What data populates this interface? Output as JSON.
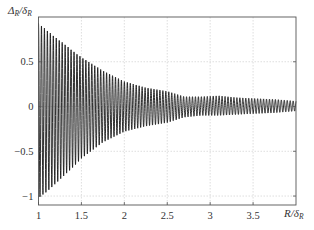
{
  "chart_data": {
    "type": "line",
    "title": "",
    "xlabel": "R/δ_R",
    "ylabel": "Δ_R/δ_R",
    "xlabel_parts": {
      "main": "R/δ",
      "sub": "R"
    },
    "ylabel_parts": {
      "main": "Δ",
      "sub1": "R",
      "mid": "/δ",
      "sub2": "R"
    },
    "xlim": [
      1,
      4
    ],
    "ylim": [
      -1.1,
      1.0
    ],
    "xticks": [
      1,
      1.5,
      2,
      2.5,
      3,
      3.5
    ],
    "xtick_labels": [
      "1",
      "1.5",
      "2",
      "2.5",
      "3",
      "3.5"
    ],
    "yticks": [
      -1,
      -0.5,
      0,
      0.5
    ],
    "ytick_labels": [
      "−1",
      "−0.5",
      "0",
      "0.5"
    ],
    "grid": true,
    "legend": null,
    "series": [
      {
        "name": "Δ_R/δ_R",
        "description": "rapid oscillation about 0 with decaying envelope",
        "oscillation_period_R": 0.0345,
        "envelope": {
          "x": [
            1.0,
            1.1,
            1.2,
            1.3,
            1.4,
            1.5,
            1.75,
            2.0,
            2.25,
            2.5,
            2.7,
            2.9,
            3.1,
            3.3,
            3.5,
            3.75,
            4.0
          ],
          "upper": [
            0.93,
            0.85,
            0.77,
            0.7,
            0.62,
            0.55,
            0.4,
            0.28,
            0.21,
            0.17,
            0.11,
            0.11,
            0.12,
            0.1,
            0.09,
            0.08,
            0.06
          ],
          "lower": [
            -1.02,
            -0.95,
            -0.86,
            -0.77,
            -0.68,
            -0.58,
            -0.4,
            -0.28,
            -0.22,
            -0.18,
            -0.12,
            -0.1,
            -0.1,
            -0.09,
            -0.08,
            -0.07,
            -0.05
          ]
        }
      }
    ],
    "colors": {
      "line": "#1a1a1a",
      "grid": "#c8c8c8",
      "frame": "#555555"
    }
  }
}
